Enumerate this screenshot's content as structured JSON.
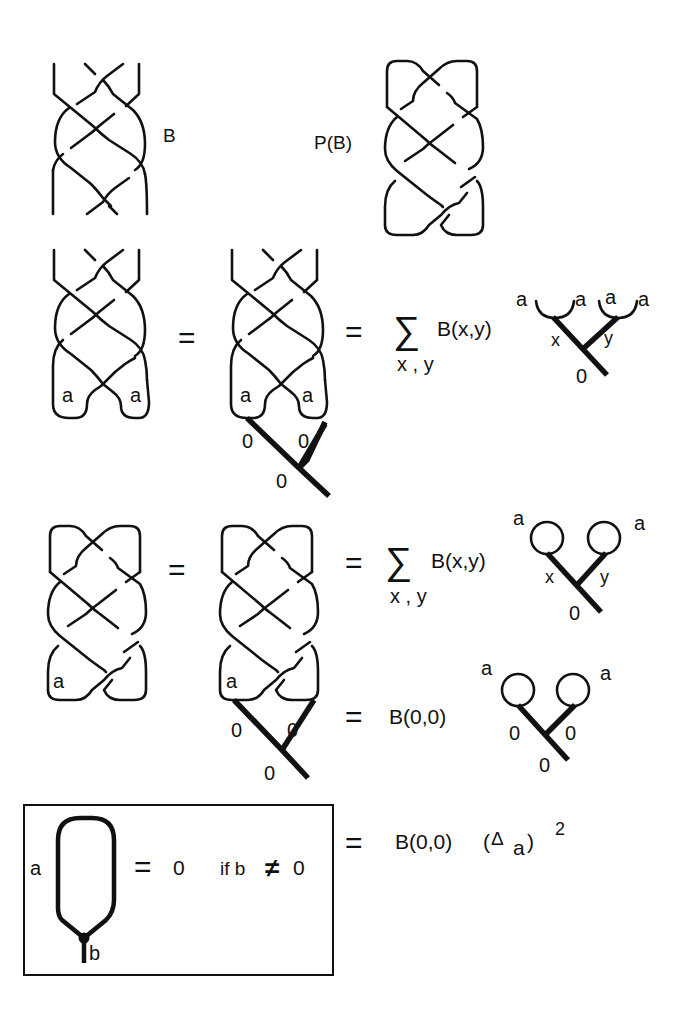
{
  "figure": {
    "row1": {
      "braid_label": "B",
      "plat_label": "P(B)"
    },
    "row2": {
      "eq1": "=",
      "eq2": "=",
      "sum_symbol": "∑",
      "sum_index": "x , y",
      "coef": "B(x,y)",
      "strand_label": "a",
      "edge_x": "x",
      "edge_y": "y",
      "zero": "0"
    },
    "row3": {
      "eq1": "=",
      "eq2": "=",
      "sum_symbol": "∑",
      "sum_index": "x , y",
      "coef": "B(x,y)",
      "strand_label": "a",
      "edge_x": "x",
      "edge_y": "y",
      "zero": "0"
    },
    "row4": {
      "eq": "=",
      "coef": "B(0,0)",
      "strand_label": "a",
      "zero": "0"
    },
    "row5": {
      "eq": "=",
      "coef": "B(0,0)",
      "delta_open": "(",
      "delta": "Δ",
      "delta_sub": "a",
      "delta_close": ")",
      "exponent": "2"
    },
    "box_lemma": {
      "loop_label": "a",
      "stem_label": "b",
      "eq": "=",
      "value": "0",
      "condition_if": "if b",
      "neq": "≠",
      "condition_value": "0"
    }
  }
}
